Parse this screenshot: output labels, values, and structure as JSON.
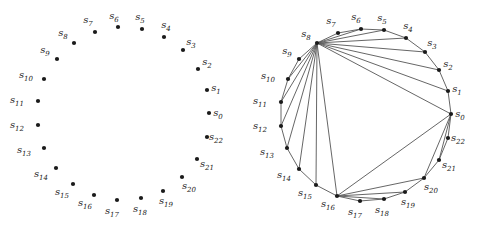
{
  "figures": [
    {
      "name": "points-only",
      "points": [
        {
          "id": "s0",
          "sub": "0",
          "x": 209,
          "y": 113,
          "lx": 218,
          "ly": 116
        },
        {
          "id": "s1",
          "sub": "1",
          "x": 207,
          "y": 90,
          "lx": 216,
          "ly": 91
        },
        {
          "id": "s2",
          "sub": "2",
          "x": 198,
          "y": 69,
          "lx": 207,
          "ly": 65
        },
        {
          "id": "s3",
          "sub": "3",
          "x": 183,
          "y": 50,
          "lx": 191,
          "ly": 45
        },
        {
          "id": "s4",
          "sub": "4",
          "x": 164,
          "y": 37,
          "lx": 166,
          "ly": 28
        },
        {
          "id": "s5",
          "sub": "5",
          "x": 142,
          "y": 29,
          "lx": 140,
          "ly": 20
        },
        {
          "id": "s6",
          "sub": "6",
          "x": 118,
          "y": 27,
          "lx": 114,
          "ly": 19
        },
        {
          "id": "s7",
          "sub": "7",
          "x": 95,
          "y": 32,
          "lx": 88,
          "ly": 23
        },
        {
          "id": "s8",
          "sub": "8",
          "x": 74,
          "y": 43,
          "lx": 63,
          "ly": 36
        },
        {
          "id": "s9",
          "sub": "9",
          "x": 57,
          "y": 59,
          "lx": 45,
          "ly": 53
        },
        {
          "id": "s10",
          "sub": "10",
          "x": 44,
          "y": 79,
          "lx": 26,
          "ly": 78
        },
        {
          "id": "s11",
          "sub": "11",
          "x": 38,
          "y": 101,
          "lx": 17,
          "ly": 103
        },
        {
          "id": "s12",
          "sub": "12",
          "x": 38,
          "y": 125,
          "lx": 17,
          "ly": 128
        },
        {
          "id": "s13",
          "sub": "13",
          "x": 44,
          "y": 148,
          "lx": 24,
          "ly": 153
        },
        {
          "id": "s14",
          "sub": "14",
          "x": 56,
          "y": 168,
          "lx": 41,
          "ly": 177
        },
        {
          "id": "s15",
          "sub": "15",
          "x": 73,
          "y": 184,
          "lx": 62,
          "ly": 195
        },
        {
          "id": "s16",
          "sub": "16",
          "x": 94,
          "y": 195,
          "lx": 85,
          "ly": 206
        },
        {
          "id": "s17",
          "sub": "17",
          "x": 117,
          "y": 200,
          "lx": 112,
          "ly": 214
        },
        {
          "id": "s18",
          "sub": "18",
          "x": 141,
          "y": 198,
          "lx": 140,
          "ly": 212
        },
        {
          "id": "s19",
          "sub": "19",
          "x": 163,
          "y": 191,
          "lx": 166,
          "ly": 204
        },
        {
          "id": "s20",
          "sub": "20",
          "x": 182,
          "y": 177,
          "lx": 189,
          "ly": 189
        },
        {
          "id": "s21",
          "sub": "21",
          "x": 197,
          "y": 159,
          "lx": 207,
          "ly": 167
        },
        {
          "id": "s22",
          "sub": "22",
          "x": 207,
          "y": 137,
          "lx": 216,
          "ly": 140
        }
      ],
      "edges": []
    },
    {
      "name": "triangulation",
      "points": [
        {
          "id": "s0",
          "sub": "0",
          "x": 451,
          "y": 114,
          "lx": 460,
          "ly": 117
        },
        {
          "id": "s1",
          "sub": "1",
          "x": 448,
          "y": 91,
          "lx": 457,
          "ly": 92
        },
        {
          "id": "s2",
          "sub": "2",
          "x": 439,
          "y": 70,
          "lx": 448,
          "ly": 67
        },
        {
          "id": "s3",
          "sub": "3",
          "x": 425,
          "y": 52,
          "lx": 432,
          "ly": 46
        },
        {
          "id": "s4",
          "sub": "4",
          "x": 406,
          "y": 38,
          "lx": 408,
          "ly": 29
        },
        {
          "id": "s5",
          "sub": "5",
          "x": 384,
          "y": 30,
          "lx": 382,
          "ly": 21
        },
        {
          "id": "s6",
          "sub": "6",
          "x": 361,
          "y": 29,
          "lx": 356,
          "ly": 20
        },
        {
          "id": "s7",
          "sub": "7",
          "x": 338,
          "y": 33,
          "lx": 331,
          "ly": 24
        },
        {
          "id": "s8",
          "sub": "8",
          "x": 317,
          "y": 43,
          "lx": 306,
          "ly": 37
        },
        {
          "id": "s9",
          "sub": "9",
          "x": 299,
          "y": 59,
          "lx": 287,
          "ly": 54
        },
        {
          "id": "s10",
          "sub": "10",
          "x": 288,
          "y": 79,
          "lx": 268,
          "ly": 79
        },
        {
          "id": "s11",
          "sub": "11",
          "x": 281,
          "y": 102,
          "lx": 260,
          "ly": 104
        },
        {
          "id": "s12",
          "sub": "12",
          "x": 281,
          "y": 126,
          "lx": 260,
          "ly": 129
        },
        {
          "id": "s13",
          "sub": "13",
          "x": 287,
          "y": 148,
          "lx": 267,
          "ly": 155
        },
        {
          "id": "s14",
          "sub": "14",
          "x": 299,
          "y": 169,
          "lx": 284,
          "ly": 178
        },
        {
          "id": "s15",
          "sub": "15",
          "x": 316,
          "y": 185,
          "lx": 305,
          "ly": 196
        },
        {
          "id": "s16",
          "sub": "16",
          "x": 337,
          "y": 196,
          "lx": 328,
          "ly": 207
        },
        {
          "id": "s17",
          "sub": "17",
          "x": 360,
          "y": 201,
          "lx": 355,
          "ly": 215
        },
        {
          "id": "s18",
          "sub": "18",
          "x": 384,
          "y": 199,
          "lx": 382,
          "ly": 213
        },
        {
          "id": "s19",
          "sub": "19",
          "x": 405,
          "y": 192,
          "lx": 408,
          "ly": 205
        },
        {
          "id": "s20",
          "sub": "20",
          "x": 424,
          "y": 178,
          "lx": 431,
          "ly": 190
        },
        {
          "id": "s21",
          "sub": "21",
          "x": 439,
          "y": 160,
          "lx": 449,
          "ly": 168
        },
        {
          "id": "s22",
          "sub": "22",
          "x": 448,
          "y": 138,
          "lx": 458,
          "ly": 141
        }
      ],
      "edges": [
        [
          0,
          1
        ],
        [
          1,
          2
        ],
        [
          2,
          3
        ],
        [
          3,
          4
        ],
        [
          4,
          5
        ],
        [
          5,
          6
        ],
        [
          6,
          7
        ],
        [
          7,
          8
        ],
        [
          8,
          9
        ],
        [
          9,
          10
        ],
        [
          10,
          11
        ],
        [
          11,
          12
        ],
        [
          12,
          13
        ],
        [
          13,
          14
        ],
        [
          14,
          15
        ],
        [
          15,
          16
        ],
        [
          16,
          17
        ],
        [
          17,
          18
        ],
        [
          18,
          19
        ],
        [
          19,
          20
        ],
        [
          20,
          21
        ],
        [
          21,
          22
        ],
        [
          22,
          0
        ],
        [
          8,
          0
        ],
        [
          8,
          1
        ],
        [
          8,
          2
        ],
        [
          8,
          3
        ],
        [
          8,
          4
        ],
        [
          8,
          5
        ],
        [
          8,
          6
        ],
        [
          8,
          10
        ],
        [
          8,
          11
        ],
        [
          8,
          12
        ],
        [
          8,
          13
        ],
        [
          8,
          14
        ],
        [
          8,
          15
        ],
        [
          8,
          16
        ],
        [
          16,
          0
        ],
        [
          16,
          18
        ],
        [
          16,
          19
        ],
        [
          16,
          20
        ],
        [
          0,
          20
        ],
        [
          0,
          21
        ]
      ]
    }
  ]
}
